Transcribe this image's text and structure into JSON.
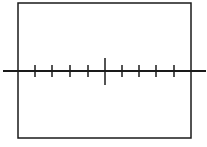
{
  "diagram": {
    "colors": {
      "stroke": "#1a1a1a",
      "background": "#ffffff"
    },
    "frame": {
      "x": 18,
      "y": 3,
      "width": 173,
      "height": 135
    },
    "axis": {
      "y": 71,
      "x_start": 3,
      "x_end": 206
    },
    "ticks": {
      "minor_half_length": 6,
      "positions_left": [
        35,
        52,
        70,
        88
      ],
      "center": 105,
      "center_top": 58,
      "center_bottom": 85,
      "positions_right": [
        122,
        139,
        156,
        174
      ]
    }
  }
}
